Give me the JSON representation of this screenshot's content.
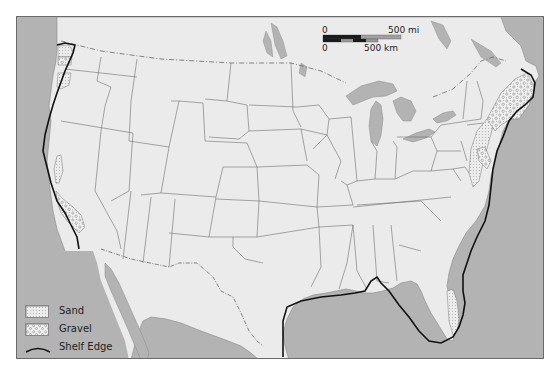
{
  "map": {
    "title": "Continental shelf sediments of the contiguous United States",
    "colors": {
      "ocean": "#b3b3b3",
      "land": "#ebebeb",
      "lakes": "#b3b3b3",
      "borders": "#6e6e6e",
      "shelf_edge": "#111111",
      "frame": "#6a6a6a"
    },
    "scale_bar": {
      "mi_zero": "0",
      "mi_label": "500 mi",
      "km_zero": "0",
      "km_label": "500 km"
    },
    "legend": {
      "items": [
        {
          "label": "Sand",
          "symbol": "sand-pattern"
        },
        {
          "label": "Gravel",
          "symbol": "gravel-pattern"
        },
        {
          "label": "Shelf Edge",
          "symbol": "shelf-edge-line"
        }
      ]
    }
  }
}
